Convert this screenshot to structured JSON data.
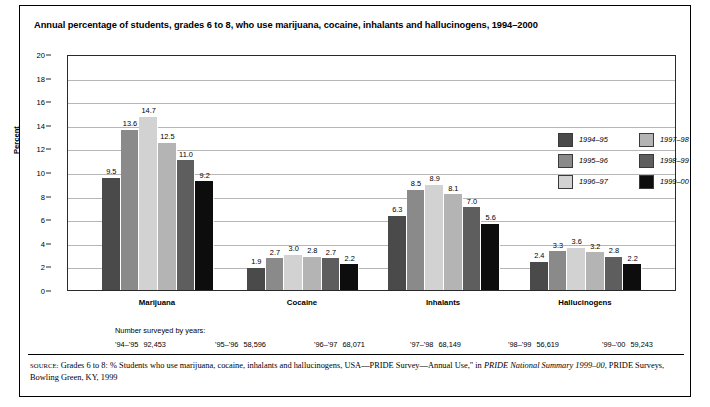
{
  "title": "Annual percentage of students, grades 6 to 8, who use marijuana, cocaine, inhalants and hallucinogens, 1994–2000",
  "axis": {
    "ylabel": "Percent",
    "yticks": [
      "20",
      "18",
      "16",
      "14",
      "12",
      "10",
      "8",
      "6",
      "4",
      "2",
      "0"
    ]
  },
  "legend": {
    "left": [
      {
        "label": "1994–95",
        "color": "#4a4a4a"
      },
      {
        "label": "1995–96",
        "color": "#8a8a8a"
      },
      {
        "label": "1996–97",
        "color": "#d2d2d2"
      }
    ],
    "right": [
      {
        "label": "1997–98",
        "color": "#b4b4b4"
      },
      {
        "label": "1998–99",
        "color": "#5e5e5e"
      },
      {
        "label": "1999–00",
        "color": "#0d0d0d"
      }
    ]
  },
  "survey": {
    "title": "Number surveyed by years:",
    "items": [
      {
        "year": "'94–'95",
        "count": "92,453"
      },
      {
        "year": "'95–'96",
        "count": "58,596"
      },
      {
        "year": "'96–'97",
        "count": "68,071"
      },
      {
        "year": "'97–'98",
        "count": "68,149"
      },
      {
        "year": "'98–'99",
        "count": "56,619"
      },
      {
        "year": "'99–'00",
        "count": "59,243"
      }
    ]
  },
  "source": {
    "keyword": "SOURCE:",
    "text_1": " Grades 6 to 8: % Students who use marijuana, cocaine, inhalants and hallucinogens, USA—PRIDE Survey—Annual Use,\" in ",
    "italic_1": "PRIDE National Summary 1999–00",
    "text_2": ", PRIDE Surveys, Bowling Green, KY, 1999"
  },
  "chart_data": {
    "type": "bar",
    "title": "Annual percentage of students, grades 6 to 8, who use marijuana, cocaine, inhalants and hallucinogens, 1994–2000",
    "xlabel": "",
    "ylabel": "Percent",
    "ylim": [
      0,
      20
    ],
    "ytick_step": 2,
    "grid": true,
    "legend_position": "inside-top-right",
    "categories": [
      "Marijuana",
      "Cocaine",
      "Inhalants",
      "Hallucinogens"
    ],
    "series": [
      {
        "name": "1994–95",
        "color": "#4a4a4a",
        "values": [
          9.5,
          1.9,
          6.3,
          2.4
        ]
      },
      {
        "name": "1995–96",
        "color": "#8a8a8a",
        "values": [
          13.6,
          2.7,
          8.5,
          3.3
        ]
      },
      {
        "name": "1996–97",
        "color": "#d2d2d2",
        "values": [
          14.7,
          3.0,
          8.9,
          3.6
        ]
      },
      {
        "name": "1997–98",
        "color": "#b4b4b4",
        "values": [
          12.5,
          2.8,
          8.1,
          3.2
        ]
      },
      {
        "name": "1998–99",
        "color": "#5e5e5e",
        "values": [
          11.0,
          2.7,
          7.0,
          2.8
        ]
      },
      {
        "name": "1999–00",
        "color": "#0d0d0d",
        "values": [
          9.2,
          2.2,
          5.6,
          2.2
        ]
      }
    ],
    "value_labels": [
      [
        "9.5",
        "13.6",
        "14.7",
        "12.5",
        "11.0",
        "9.2"
      ],
      [
        "1.9",
        "2.7",
        "3.0",
        "2.8",
        "2.7",
        "2.2"
      ],
      [
        "6.3",
        "8.5",
        "8.9",
        "8.1",
        "7.0",
        "5.6"
      ],
      [
        "2.4",
        "3.3",
        "3.6",
        "3.2",
        "2.8",
        "2.2"
      ]
    ]
  }
}
